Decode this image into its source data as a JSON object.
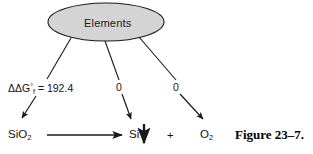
{
  "figure": {
    "caption": "Figure 23–7.",
    "source_node": {
      "label": "Elements",
      "shape": "ellipse",
      "fill_color": "#d4d4d4",
      "stroke_color": "#1a1a1a"
    },
    "edges": [
      {
        "id": "edge-to-sio2",
        "label": "ΔG",
        "label_sub": "f",
        "label_sup": "°",
        "label_value": "= 192.4",
        "target": "SiO2"
      },
      {
        "id": "edge-to-si",
        "label": "0",
        "target": "Si"
      },
      {
        "id": "edge-to-o2",
        "label": "0",
        "target": "O2"
      }
    ],
    "reaction": {
      "reactant": "SiO",
      "reactant_sub": "2",
      "arrow": "reaction-arrow-right",
      "product_1": "Si",
      "product_1_marker": "down-arrow",
      "operator": "+",
      "product_2": "O",
      "product_2_sub": "2"
    },
    "colors": {
      "line": "#1a1a1a",
      "text": "#111111",
      "background": "#ffffff"
    }
  }
}
